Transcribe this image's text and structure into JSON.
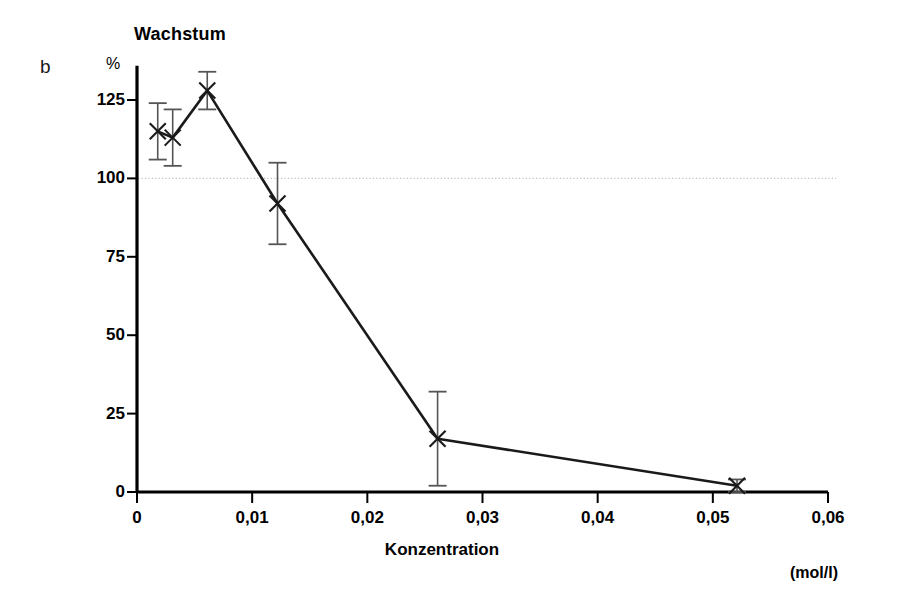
{
  "figure": {
    "panel_label": "b",
    "title": "Wachstum",
    "y_unit": "%",
    "x_axis_label": "Konzentration",
    "x_unit": "(mol/l)",
    "line_color": "#1a1a1a",
    "reference_line_color": "#bfbfbf",
    "axis_color": "#000000"
  },
  "chart_data": {
    "type": "line",
    "title": "Wachstum",
    "xlabel": "Konzentration",
    "ylabel": "Wachstum",
    "x_unit": "(mol/l)",
    "y_unit": "%",
    "xlim": [
      0,
      0.06
    ],
    "ylim": [
      0,
      135
    ],
    "xticks": [
      0,
      0.01,
      0.02,
      0.03,
      0.04,
      0.05,
      0.06
    ],
    "xtick_labels": [
      "0",
      "0,01",
      "0,02",
      "0,03",
      "0,04",
      "0,05",
      "0,06"
    ],
    "yticks": [
      0,
      25,
      50,
      75,
      100,
      125
    ],
    "ytick_labels": [
      "0",
      "25",
      "50",
      "75",
      "100",
      "125"
    ],
    "grid": false,
    "reference_line": {
      "y": 100,
      "style": "dotted",
      "label": ""
    },
    "marker": "x",
    "error_bars": true,
    "legend": null,
    "series": [
      {
        "name": "Wachstum",
        "x": [
          0.0018,
          0.0031,
          0.0061,
          0.0122,
          0.0261,
          0.0521
        ],
        "y": [
          115,
          113,
          128,
          92,
          17,
          2
        ],
        "yerr": [
          9,
          9,
          6,
          13,
          15,
          2
        ]
      }
    ],
    "points": [
      {
        "x": 0.0018,
        "y": 115,
        "yerr": 9,
        "low": 106,
        "high": 124
      },
      {
        "x": 0.0031,
        "y": 113,
        "yerr": 9,
        "low": 104,
        "high": 122
      },
      {
        "x": 0.0061,
        "y": 128,
        "yerr": 6,
        "low": 122,
        "high": 134
      },
      {
        "x": 0.0122,
        "y": 92,
        "yerr": 13,
        "low": 79,
        "high": 105
      },
      {
        "x": 0.0261,
        "y": 17,
        "yerr": 15,
        "low": 2,
        "high": 32
      },
      {
        "x": 0.0521,
        "y": 2,
        "yerr": 2,
        "low": 0,
        "high": 4
      }
    ]
  }
}
